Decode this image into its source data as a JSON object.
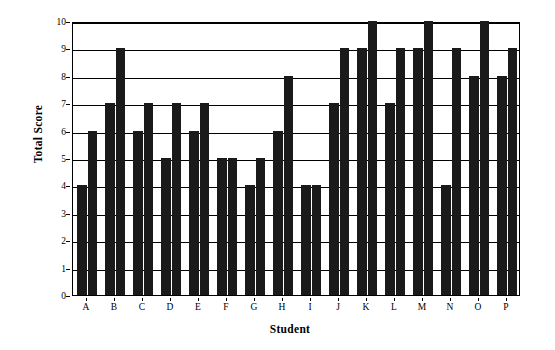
{
  "chart_data": {
    "type": "bar",
    "title": "",
    "xlabel": "Student",
    "ylabel": "Total Score",
    "categories": [
      "A",
      "B",
      "C",
      "D",
      "E",
      "F",
      "G",
      "H",
      "I",
      "J",
      "K",
      "L",
      "M",
      "N",
      "O",
      "P"
    ],
    "series": [
      {
        "name": "Series 1",
        "values": [
          4,
          7,
          6,
          5,
          6,
          5,
          4,
          6,
          4,
          7,
          9,
          7,
          9,
          4,
          8,
          8
        ]
      },
      {
        "name": "Series 2",
        "values": [
          6,
          9,
          7,
          7,
          7,
          5,
          5,
          8,
          4,
          9,
          10,
          9,
          10,
          9,
          10,
          9
        ]
      }
    ],
    "ylim": [
      0,
      10
    ],
    "yticks": [
      0,
      1,
      2,
      3,
      4,
      5,
      6,
      7,
      8,
      9,
      10
    ],
    "ytick_labels": [
      "0",
      "1",
      "2",
      "3",
      "4",
      "5",
      "6",
      "7",
      "8",
      "9",
      "10"
    ],
    "grid": true,
    "grid_axis": "y",
    "legend": false,
    "legend_position": "none",
    "bar_color": "#1a1a1a",
    "background_color": "#ffffff",
    "axis_color": "#000000"
  },
  "axes": {
    "y_title": "Total Score",
    "x_title": "Student"
  }
}
